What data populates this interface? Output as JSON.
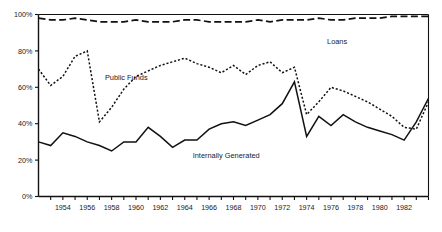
{
  "chart_data": {
    "type": "line",
    "title": "",
    "xlabel": "",
    "ylabel": "",
    "ylim": [
      0,
      100
    ],
    "xlim": [
      1952,
      1984
    ],
    "grid": false,
    "legend_position": "inline-annotations",
    "y_ticks": [
      "0%",
      "20%",
      "40%",
      "60%",
      "80%",
      "100%"
    ],
    "y_tick_values": [
      0,
      20,
      40,
      60,
      80,
      100
    ],
    "x_ticks": [
      "1954",
      "1956",
      "1958",
      "1960",
      "1962",
      "1964",
      "1966",
      "1968",
      "1970",
      "1972",
      "1974",
      "1976",
      "1978",
      "1980",
      "1982"
    ],
    "x_tick_values": [
      1954,
      1956,
      1958,
      1960,
      1962,
      1964,
      1966,
      1968,
      1970,
      1972,
      1974,
      1976,
      1978,
      1980,
      1982
    ],
    "x": [
      1952,
      1953,
      1954,
      1955,
      1956,
      1957,
      1958,
      1959,
      1960,
      1961,
      1962,
      1963,
      1964,
      1965,
      1966,
      1967,
      1968,
      1969,
      1970,
      1971,
      1972,
      1973,
      1974,
      1975,
      1976,
      1977,
      1978,
      1979,
      1980,
      1981,
      1982,
      1983,
      1984
    ],
    "series": [
      {
        "name": "Loans",
        "style": "dashed",
        "label_x": 1976.5,
        "label_y": 84,
        "values": [
          98,
          97,
          97,
          98,
          97,
          96,
          96,
          96,
          97,
          96,
          96,
          96,
          97,
          97,
          96,
          96,
          96,
          96,
          97,
          96,
          97,
          97,
          97,
          98,
          97,
          97,
          98,
          98,
          98,
          99,
          99,
          99,
          99
        ]
      },
      {
        "name": "Public Funds",
        "style": "dotted",
        "label_x": 1959.2,
        "label_y": 64,
        "values": [
          70,
          61,
          66,
          77,
          80,
          41,
          49,
          59,
          66,
          69,
          72,
          74,
          76,
          73,
          71,
          68,
          72,
          67,
          72,
          74,
          68,
          71,
          45,
          52,
          60,
          58,
          55,
          52,
          48,
          44,
          38,
          37,
          52
        ]
      },
      {
        "name": "Internally Generated",
        "style": "solid",
        "label_x": 1967.4,
        "label_y": 21,
        "values": [
          30,
          28,
          35,
          33,
          30,
          28,
          25,
          30,
          30,
          38,
          33,
          27,
          31,
          31,
          37,
          40,
          41,
          39,
          42,
          45,
          51,
          63,
          33,
          44,
          39,
          45,
          41,
          38,
          36,
          34,
          31,
          41,
          54
        ]
      }
    ]
  }
}
